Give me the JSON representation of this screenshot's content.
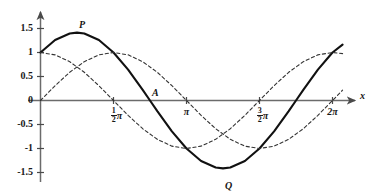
{
  "chart_data": {
    "type": "line",
    "title": "",
    "xlabel": "x",
    "ylabel": "",
    "xlim": [
      -0.18,
      6.7
    ],
    "ylim": [
      -1.78,
      1.72
    ],
    "grid": false,
    "legend": "none",
    "x_ticks": [
      {
        "value": 1.5707963,
        "label": "1/2 pi",
        "num": "1",
        "den": "2",
        "pi": "π"
      },
      {
        "value": 3.1415927,
        "label": "pi",
        "num": "",
        "den": "",
        "pi": "π"
      },
      {
        "value": 4.712389,
        "label": "3/2 pi",
        "num": "3",
        "den": "2",
        "pi": "π"
      },
      {
        "value": 6.2831853,
        "label": "2 pi",
        "num": "",
        "den": "",
        "pi": "2π"
      }
    ],
    "y_ticks": [
      {
        "value": 1.5,
        "label": "1.5"
      },
      {
        "value": 1.0,
        "label": "1"
      },
      {
        "value": 0.5,
        "label": "0.5"
      },
      {
        "value": 0.0,
        "label": "0"
      },
      {
        "value": -0.5,
        "label": "-0.5"
      },
      {
        "value": -1.0,
        "label": "-1"
      },
      {
        "value": -1.5,
        "label": "-1.5"
      }
    ],
    "series": [
      {
        "name": "sum-curve",
        "expression": "sin(x) + cos(x)",
        "style": "solid",
        "width": 2.1,
        "color": "#111111",
        "x": [
          0.0,
          0.3141593,
          0.6283185,
          0.7853982,
          0.9424778,
          1.2566371,
          1.5707963,
          1.8849556,
          2.1991149,
          2.3561945,
          2.5132741,
          2.8274334,
          3.1415927,
          3.4557519,
          3.7699112,
          3.9269908,
          4.0840704,
          4.3982297,
          4.712389,
          5.0265482,
          5.3407075,
          5.4977871,
          5.6548668,
          5.969026,
          6.2831853,
          6.5
        ],
        "y": [
          1.0,
          1.2601,
          1.3968,
          1.4142,
          1.3968,
          1.2601,
          1.0,
          0.642,
          0.2212,
          0.0,
          -0.2212,
          -0.642,
          -1.0,
          -1.2601,
          -1.3968,
          -1.4142,
          -1.3968,
          -1.2601,
          -1.0,
          -0.642,
          -0.2212,
          0.0,
          0.2212,
          0.642,
          1.0,
          1.1626
        ]
      },
      {
        "name": "cosine-curve",
        "expression": "cos(x)",
        "style": "dashed",
        "width": 1.1,
        "color": "#333333",
        "x": [
          0.0,
          0.3141593,
          0.6283185,
          0.9424778,
          1.2566371,
          1.5707963,
          1.8849556,
          2.1991149,
          2.5132741,
          2.8274334,
          3.1415927,
          3.4557519,
          3.7699112,
          4.0840704,
          4.3982297,
          4.712389,
          5.0265482,
          5.3407075,
          5.6548668,
          5.969026,
          6.2831853,
          6.5
        ],
        "y": [
          1.0,
          0.9511,
          0.809,
          0.5878,
          0.309,
          0.0,
          -0.309,
          -0.5878,
          -0.809,
          -0.9511,
          -1.0,
          -0.9511,
          -0.809,
          -0.5878,
          -0.309,
          0.0,
          0.309,
          0.5878,
          0.809,
          0.9511,
          1.0,
          0.9768
        ]
      },
      {
        "name": "sine-curve",
        "expression": "sin(x)",
        "style": "dashed",
        "width": 1.1,
        "color": "#333333",
        "x": [
          0.0,
          0.3141593,
          0.6283185,
          0.9424778,
          1.2566371,
          1.5707963,
          1.8849556,
          2.1991149,
          2.5132741,
          2.8274334,
          3.1415927,
          3.4557519,
          3.7699112,
          4.0840704,
          4.3982297,
          4.712389,
          5.0265482,
          5.3407075,
          5.6548668,
          5.969026,
          6.2831853,
          6.5
        ],
        "y": [
          0.0,
          0.309,
          0.5878,
          0.809,
          0.9511,
          1.0,
          0.9511,
          0.809,
          0.5878,
          0.309,
          0.0,
          -0.309,
          -0.5878,
          -0.809,
          -0.9511,
          -1.0,
          -0.9511,
          -0.809,
          -0.5878,
          -0.309,
          0.0,
          0.2151
        ]
      }
    ],
    "annotations": [
      {
        "name": "point-P",
        "label": "P",
        "x": 0.7853982,
        "y": 1.4142,
        "dx": 2,
        "dy": -13,
        "note": "maximum of sum curve"
      },
      {
        "name": "point-A",
        "label": "A",
        "x": 2.3561945,
        "y": 0.0,
        "dx": 2,
        "dy": -13,
        "note": "x-intercept of sum curve"
      },
      {
        "name": "point-Q",
        "label": "Q",
        "x": 3.9269908,
        "y": -1.4142,
        "dx": 2,
        "dy": 13,
        "note": "minimum of sum curve"
      }
    ]
  },
  "axes": {
    "x_axis_name": "x",
    "arrow_x": true,
    "arrow_y": true
  },
  "colors": {
    "background": "#ffffff",
    "axis": "#6b6b6b",
    "solid_curve": "#111111",
    "dashed_curve": "#333333",
    "text": "#181818"
  }
}
